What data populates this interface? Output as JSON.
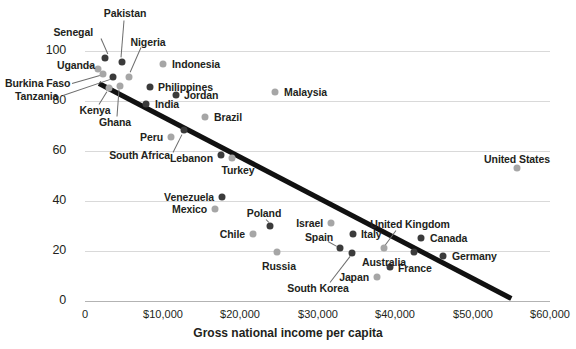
{
  "chart_data": {
    "type": "scatter",
    "title": "",
    "xlabel": "Gross national income per capita",
    "ylabel": "",
    "xlim": [
      0,
      60000
    ],
    "ylim": [
      0,
      110
    ],
    "grid": true,
    "legend": "none",
    "xticks": [
      "0",
      "$10,000",
      "$20,000",
      "$30,000",
      "$40,000",
      "$50,000",
      "$60,000"
    ],
    "xtick_values": [
      0,
      10000,
      20000,
      30000,
      40000,
      50000,
      60000
    ],
    "yticks": [
      "0",
      "20",
      "40",
      "60",
      "80",
      "100"
    ],
    "ytick_values": [
      0,
      20,
      40,
      60,
      80,
      100
    ],
    "trendline": {
      "x0": 1800,
      "y0": 88,
      "x1": 55000,
      "y1": 2
    },
    "points": [
      {
        "name": "Senegal",
        "x": 2600,
        "y": 97,
        "shade": "dark",
        "px": 105,
        "py": 58
      },
      {
        "name": "Uganda",
        "x": 1700,
        "y": 92,
        "shade": "light",
        "px": 98,
        "py": 69
      },
      {
        "name": "Pakistan",
        "x": 4800,
        "y": 95,
        "shade": "dark",
        "px": 122,
        "py": 62
      },
      {
        "name": "Burkina Faso",
        "x": 2300,
        "y": 90,
        "shade": "light",
        "px": 103,
        "py": 74
      },
      {
        "name": "Tanzania",
        "x": 3600,
        "y": 89,
        "shade": "dark",
        "px": 113,
        "py": 77
      },
      {
        "name": "Nigeria",
        "x": 5700,
        "y": 89,
        "shade": "light",
        "px": 129,
        "py": 77
      },
      {
        "name": "Kenya",
        "x": 3100,
        "y": 85,
        "shade": "light",
        "px": 109,
        "py": 88
      },
      {
        "name": "Ghana",
        "x": 4500,
        "y": 86,
        "shade": "light",
        "px": 120,
        "py": 86
      },
      {
        "name": "Indonesia",
        "x": 10000,
        "y": 94,
        "shade": "light",
        "px": 163,
        "py": 64
      },
      {
        "name": "Philippines",
        "x": 8400,
        "y": 85,
        "shade": "dark",
        "px": 150,
        "py": 87
      },
      {
        "name": "Jordan",
        "x": 11700,
        "y": 82,
        "shade": "dark",
        "px": 176,
        "py": 95
      },
      {
        "name": "India",
        "x": 7900,
        "y": 79,
        "shade": "dark",
        "px": 146,
        "py": 104
      },
      {
        "name": "Malaysia",
        "x": 24500,
        "y": 84,
        "shade": "light",
        "px": 275,
        "py": 92
      },
      {
        "name": "Brazil",
        "x": 15500,
        "y": 74,
        "shade": "light",
        "px": 205,
        "py": 117
      },
      {
        "name": "Peru",
        "x": 11100,
        "y": 66,
        "shade": "light",
        "px": 171,
        "py": 137
      },
      {
        "name": "South Africa",
        "x": 12800,
        "y": 68,
        "shade": "dark",
        "px": 184,
        "py": 130
      },
      {
        "name": "Lebanon",
        "x": 17600,
        "y": 58,
        "shade": "dark",
        "px": 221,
        "py": 155
      },
      {
        "name": "Turkey",
        "x": 19000,
        "y": 57,
        "shade": "light",
        "px": 232,
        "py": 158
      },
      {
        "name": "Venezuela",
        "x": 17700,
        "y": 42,
        "shade": "dark",
        "px": 222,
        "py": 197
      },
      {
        "name": "Mexico",
        "x": 16800,
        "y": 37,
        "shade": "light",
        "px": 215,
        "py": 209
      },
      {
        "name": "Chile",
        "x": 21700,
        "y": 27,
        "shade": "light",
        "px": 253,
        "py": 234
      },
      {
        "name": "Poland",
        "x": 23900,
        "y": 30,
        "shade": "dark",
        "px": 270,
        "py": 226
      },
      {
        "name": "Russia",
        "x": 24800,
        "y": 20,
        "shade": "light",
        "px": 277,
        "py": 252
      },
      {
        "name": "Israel",
        "x": 31800,
        "y": 31,
        "shade": "light",
        "px": 331,
        "py": 223
      },
      {
        "name": "Italy",
        "x": 34600,
        "y": 27,
        "shade": "dark",
        "px": 353,
        "py": 234
      },
      {
        "name": "Spain",
        "x": 32900,
        "y": 21,
        "shade": "dark",
        "px": 340,
        "py": 248
      },
      {
        "name": "South Korea",
        "x": 34500,
        "y": 19,
        "shade": "dark",
        "px": 352,
        "py": 253
      },
      {
        "name": "United Kingdom",
        "x": 38600,
        "y": 21,
        "shade": "light",
        "px": 384,
        "py": 248
      },
      {
        "name": "Australia",
        "x": 42400,
        "y": 20,
        "shade": "dark",
        "px": 414,
        "py": 252
      },
      {
        "name": "France",
        "x": 39400,
        "y": 14,
        "shade": "dark",
        "px": 390,
        "py": 267
      },
      {
        "name": "Japan",
        "x": 37700,
        "y": 10,
        "shade": "light",
        "px": 377,
        "py": 277
      },
      {
        "name": "Canada",
        "x": 43400,
        "y": 25,
        "shade": "dark",
        "px": 421,
        "py": 238
      },
      {
        "name": "Germany",
        "x": 46200,
        "y": 18,
        "shade": "dark",
        "px": 443,
        "py": 256
      },
      {
        "name": "United States",
        "x": 55700,
        "y": 53,
        "shade": "light",
        "px": 517,
        "py": 168
      }
    ],
    "labels": [
      {
        "name": "Senegal",
        "px": 93,
        "py": 32,
        "align": "r",
        "leader": {
          "x1": 101,
          "y1": 38,
          "x2": 108,
          "y2": 54
        }
      },
      {
        "name": "Pakistan",
        "px": 125,
        "py": 13,
        "align": "c",
        "leader": {
          "x1": 124,
          "y1": 20,
          "x2": 121,
          "y2": 57
        }
      },
      {
        "name": "Nigeria",
        "px": 148,
        "py": 42,
        "align": "c",
        "leader": {
          "x1": 141,
          "y1": 47,
          "x2": 130,
          "y2": 72
        }
      },
      {
        "name": "Uganda",
        "px": 57,
        "py": 65,
        "align": "l",
        "leader": {
          "x1": 88,
          "y1": 65,
          "x2": 94,
          "y2": 67
        }
      },
      {
        "name": "Burkina Faso",
        "px": 5,
        "py": 83,
        "align": "l",
        "leader": {
          "x1": 72,
          "y1": 83,
          "x2": 100,
          "y2": 75
        }
      },
      {
        "name": "Tanzania",
        "px": 15,
        "py": 96,
        "align": "l",
        "leader": {
          "x1": 63,
          "y1": 95,
          "x2": 110,
          "y2": 79
        }
      },
      {
        "name": "Kenya",
        "px": 95,
        "py": 110,
        "align": "c",
        "leader": {
          "x1": 99,
          "y1": 104,
          "x2": 107,
          "y2": 91
        }
      },
      {
        "name": "Ghana",
        "px": 115,
        "py": 122,
        "align": "c",
        "leader": {
          "x1": 117,
          "y1": 116,
          "x2": 119,
          "y2": 89
        }
      },
      {
        "name": "Indonesia",
        "px": 172,
        "py": 64,
        "align": "l",
        "leader": null
      },
      {
        "name": "Philippines",
        "px": 158,
        "py": 87,
        "align": "l",
        "leader": null
      },
      {
        "name": "Jordan",
        "px": 184,
        "py": 95,
        "align": "l",
        "leader": null
      },
      {
        "name": "India",
        "px": 155,
        "py": 104,
        "align": "l",
        "leader": null
      },
      {
        "name": "Malaysia",
        "px": 284,
        "py": 92,
        "align": "l",
        "leader": null
      },
      {
        "name": "Brazil",
        "px": 214,
        "py": 117,
        "align": "l",
        "leader": null
      },
      {
        "name": "Peru",
        "px": 163,
        "py": 137,
        "align": "r",
        "leader": null
      },
      {
        "name": "South Africa",
        "px": 170,
        "py": 155,
        "align": "r",
        "leader": {
          "x1": 173,
          "y1": 152,
          "x2": 182,
          "y2": 134
        }
      },
      {
        "name": "Lebanon",
        "px": 213,
        "py": 158,
        "align": "r",
        "leader": null
      },
      {
        "name": "Turkey",
        "px": 238,
        "py": 170,
        "align": "c",
        "leader": null
      },
      {
        "name": "Venezuela",
        "px": 214,
        "py": 197,
        "align": "r",
        "leader": null
      },
      {
        "name": "Mexico",
        "px": 207,
        "py": 209,
        "align": "r",
        "leader": null
      },
      {
        "name": "Chile",
        "px": 245,
        "py": 234,
        "align": "r",
        "leader": null
      },
      {
        "name": "Poland",
        "px": 264,
        "py": 213,
        "align": "c",
        "leader": {
          "x1": 266,
          "y1": 219,
          "x2": 269,
          "y2": 222
        }
      },
      {
        "name": "Russia",
        "px": 279,
        "py": 266,
        "align": "c",
        "leader": null
      },
      {
        "name": "Israel",
        "px": 323,
        "py": 223,
        "align": "r",
        "leader": null
      },
      {
        "name": "Italy",
        "px": 361,
        "py": 234,
        "align": "l",
        "leader": null
      },
      {
        "name": "Spain",
        "px": 319,
        "py": 237,
        "align": "c",
        "leader": {
          "x1": 328,
          "y1": 241,
          "x2": 337,
          "y2": 246
        }
      },
      {
        "name": "South Korea",
        "px": 318,
        "py": 288,
        "align": "c",
        "leader": {
          "x1": 330,
          "y1": 282,
          "x2": 350,
          "y2": 256
        }
      },
      {
        "name": "United Kingdom",
        "px": 410,
        "py": 224,
        "align": "c",
        "leader": {
          "x1": 396,
          "y1": 230,
          "x2": 385,
          "y2": 245
        }
      },
      {
        "name": "Australia",
        "px": 406,
        "py": 262,
        "align": "r",
        "leader": null
      },
      {
        "name": "France",
        "px": 398,
        "py": 268,
        "align": "l",
        "leader": null
      },
      {
        "name": "Japan",
        "px": 369,
        "py": 277,
        "align": "r",
        "leader": null
      },
      {
        "name": "Canada",
        "px": 430,
        "py": 238,
        "align": "l",
        "leader": null
      },
      {
        "name": "Germany",
        "px": 452,
        "py": 256,
        "align": "l",
        "leader": null
      },
      {
        "name": "United States",
        "px": 517,
        "py": 159,
        "align": "c",
        "leader": null
      }
    ],
    "colors": {
      "dark": "#3b3b3b",
      "light": "#a6a6a6",
      "trendline": "#111111",
      "grid": "#d9d9d9",
      "text": "#231f20"
    }
  }
}
